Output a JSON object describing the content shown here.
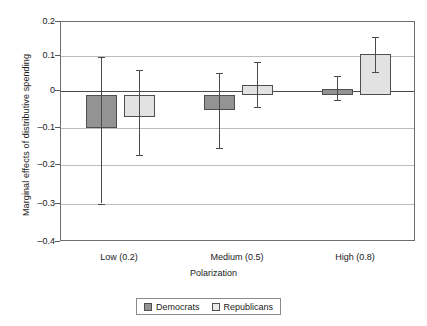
{
  "chart_data": {
    "type": "bar",
    "title": "",
    "xlabel": "Polarization",
    "ylabel": "Marginal effects of distributive spending",
    "categories": [
      "Low (0.2)",
      "Medium (0.5)",
      "High (0.8)"
    ],
    "ylim": [
      -0.4,
      0.2
    ],
    "yticks": [
      "0.2",
      "0.1",
      "0",
      "–0.1",
      "–0.2",
      "–0.3",
      "–0.4"
    ],
    "ytick_values": [
      0.2,
      0.1,
      0,
      -0.1,
      -0.2,
      -0.3,
      -0.4
    ],
    "grid": true,
    "legend_position": "bottom",
    "error_bars": "confidence-interval",
    "series": [
      {
        "name": "Democrats",
        "color": "#939393",
        "values": [
          -0.09,
          -0.04,
          0.018
        ],
        "error_low": [
          -0.295,
          -0.143,
          -0.013
        ],
        "error_high": [
          0.105,
          0.062,
          0.052
        ]
      },
      {
        "name": "Republicans",
        "color": "#e2e2e2",
        "values": [
          -0.058,
          0.027,
          0.113
        ],
        "error_low": [
          -0.162,
          -0.032,
          0.063
        ],
        "error_high": [
          0.07,
          0.092,
          0.159
        ]
      }
    ]
  },
  "legend": {
    "items": [
      {
        "label": "Democrats",
        "swatch": "dem"
      },
      {
        "label": "Republicans",
        "swatch": "rep"
      }
    ]
  }
}
